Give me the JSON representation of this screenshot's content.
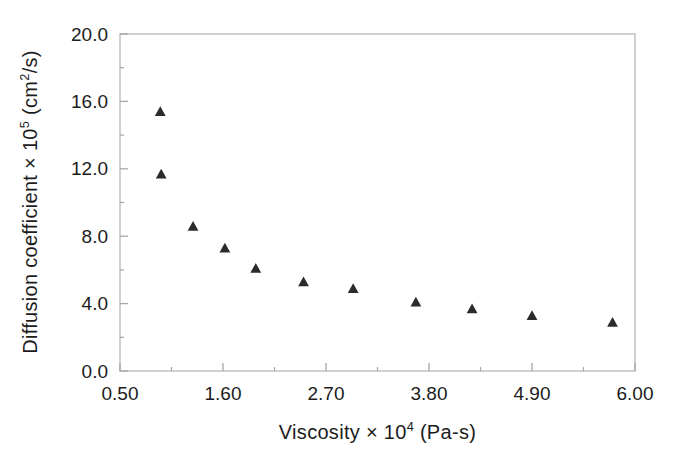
{
  "figure": {
    "background": "#ffffff",
    "border_color": "#bcbcbc",
    "tick_color": "#a6a6a6",
    "text_color": "#1c1c1c",
    "marker_color": "#2b2b2b"
  },
  "chart_data": {
    "type": "scatter",
    "title": "",
    "xlabel": "Viscosity × 10⁴ (Pa-s)",
    "ylabel": "Diffusion coefficient × 10⁵ (cm²/s)",
    "xlabel_parts": {
      "pre": "Viscosity × 10",
      "sup": "4",
      "post": " (Pa-s)"
    },
    "ylabel_parts": {
      "pre": "Diffusion coefficient × 10",
      "sup1": "5",
      "mid": " (cm",
      "sup2": "2",
      "post": "/s)"
    },
    "xlim": [
      0.5,
      6.0
    ],
    "ylim": [
      0.0,
      20.0
    ],
    "grid": false,
    "legend": null,
    "marker": "triangle-up",
    "x_major_tick_values": [
      0.5,
      1.6,
      2.7,
      3.8,
      4.9,
      6.0
    ],
    "x_major_tick_labels": [
      "0.50",
      "1.60",
      "2.70",
      "3.80",
      "4.90",
      "6.00"
    ],
    "x_minor_tick_values": [
      1.05,
      2.15,
      3.25,
      4.35,
      5.45
    ],
    "y_major_tick_values": [
      0.0,
      4.0,
      8.0,
      12.0,
      16.0,
      20.0
    ],
    "y_major_tick_labels": [
      "0.0",
      "4.0",
      "8.0",
      "12.0",
      "16.0",
      "20.0"
    ],
    "y_minor_tick_values": [
      2.0,
      6.0,
      10.0,
      14.0,
      18.0
    ],
    "series": [
      {
        "name": "diffusion-coefficient-vs-viscosity",
        "points": [
          {
            "x": 0.93,
            "y": 15.4
          },
          {
            "x": 0.94,
            "y": 11.7
          },
          {
            "x": 1.28,
            "y": 8.6
          },
          {
            "x": 1.62,
            "y": 7.3
          },
          {
            "x": 1.95,
            "y": 6.1
          },
          {
            "x": 2.46,
            "y": 5.3
          },
          {
            "x": 2.99,
            "y": 4.9
          },
          {
            "x": 3.66,
            "y": 4.1
          },
          {
            "x": 4.26,
            "y": 3.7
          },
          {
            "x": 4.9,
            "y": 3.3
          },
          {
            "x": 5.76,
            "y": 2.9
          }
        ]
      }
    ]
  }
}
